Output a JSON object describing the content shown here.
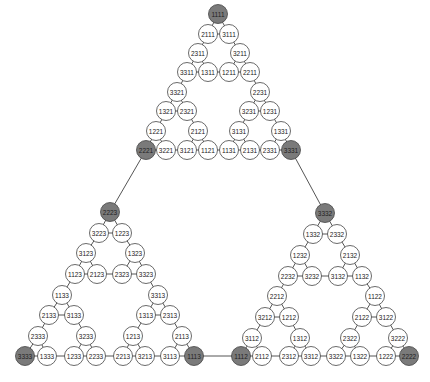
{
  "diagram": {
    "type": "sierpinski-graph",
    "node_radius": 9.5,
    "colors": {
      "node_fill": "#ffffff",
      "extreme_node_fill": "#7a7a7a",
      "edge": "#555555",
      "node_stroke": "#444444"
    },
    "nodes": [
      {
        "id": "1111",
        "x": 218,
        "y": 14,
        "extreme": true
      },
      {
        "id": "2111",
        "x": 208,
        "y": 34
      },
      {
        "id": "3111",
        "x": 229,
        "y": 34
      },
      {
        "id": "2311",
        "x": 198,
        "y": 53
      },
      {
        "id": "3211",
        "x": 240,
        "y": 53
      },
      {
        "id": "3311",
        "x": 187,
        "y": 72
      },
      {
        "id": "1311",
        "x": 208,
        "y": 72
      },
      {
        "id": "1211",
        "x": 229,
        "y": 72
      },
      {
        "id": "2211",
        "x": 250,
        "y": 72
      },
      {
        "id": "3321",
        "x": 177,
        "y": 92
      },
      {
        "id": "2231",
        "x": 260,
        "y": 92
      },
      {
        "id": "1321",
        "x": 166,
        "y": 111
      },
      {
        "id": "2321",
        "x": 187,
        "y": 111
      },
      {
        "id": "3231",
        "x": 249,
        "y": 111
      },
      {
        "id": "1231",
        "x": 270,
        "y": 111
      },
      {
        "id": "1221",
        "x": 156,
        "y": 131
      },
      {
        "id": "2121",
        "x": 198,
        "y": 131
      },
      {
        "id": "3131",
        "x": 239,
        "y": 131
      },
      {
        "id": "1331",
        "x": 281,
        "y": 131
      },
      {
        "id": "2221",
        "x": 146,
        "y": 150,
        "extreme": true
      },
      {
        "id": "3221",
        "x": 166,
        "y": 150
      },
      {
        "id": "3121",
        "x": 187,
        "y": 150
      },
      {
        "id": "1121",
        "x": 208,
        "y": 150
      },
      {
        "id": "1131",
        "x": 229,
        "y": 150
      },
      {
        "id": "2131",
        "x": 250,
        "y": 150
      },
      {
        "id": "2331",
        "x": 270,
        "y": 150
      },
      {
        "id": "3331",
        "x": 291,
        "y": 150,
        "extreme": true
      },
      {
        "id": "2223",
        "x": 110,
        "y": 212,
        "extreme": true
      },
      {
        "id": "3223",
        "x": 99,
        "y": 233
      },
      {
        "id": "1223",
        "x": 122,
        "y": 233
      },
      {
        "id": "3123",
        "x": 86,
        "y": 253
      },
      {
        "id": "1323",
        "x": 135,
        "y": 253
      },
      {
        "id": "1123",
        "x": 75,
        "y": 274
      },
      {
        "id": "2123",
        "x": 97,
        "y": 274
      },
      {
        "id": "2323",
        "x": 122,
        "y": 274
      },
      {
        "id": "3323",
        "x": 146,
        "y": 274
      },
      {
        "id": "1133",
        "x": 62,
        "y": 295
      },
      {
        "id": "3313",
        "x": 158,
        "y": 295
      },
      {
        "id": "2133",
        "x": 49,
        "y": 315
      },
      {
        "id": "3133",
        "x": 74,
        "y": 315
      },
      {
        "id": "1313",
        "x": 146,
        "y": 315
      },
      {
        "id": "2313",
        "x": 170,
        "y": 315
      },
      {
        "id": "2333",
        "x": 38,
        "y": 336
      },
      {
        "id": "3233",
        "x": 86,
        "y": 336
      },
      {
        "id": "1213",
        "x": 133,
        "y": 336
      },
      {
        "id": "2113",
        "x": 182,
        "y": 336
      },
      {
        "id": "3333",
        "x": 25,
        "y": 356,
        "extreme": true
      },
      {
        "id": "1333",
        "x": 47,
        "y": 356
      },
      {
        "id": "1233",
        "x": 74,
        "y": 356
      },
      {
        "id": "2233",
        "x": 96,
        "y": 356
      },
      {
        "id": "2213",
        "x": 123,
        "y": 356
      },
      {
        "id": "3213",
        "x": 145,
        "y": 356
      },
      {
        "id": "3113",
        "x": 170,
        "y": 356
      },
      {
        "id": "1113",
        "x": 194,
        "y": 356,
        "extreme": true
      },
      {
        "id": "3332",
        "x": 325,
        "y": 213,
        "extreme": true
      },
      {
        "id": "1332",
        "x": 313,
        "y": 234
      },
      {
        "id": "2332",
        "x": 337,
        "y": 234
      },
      {
        "id": "1232",
        "x": 300,
        "y": 255
      },
      {
        "id": "2132",
        "x": 350,
        "y": 255
      },
      {
        "id": "2232",
        "x": 288,
        "y": 276
      },
      {
        "id": "3232",
        "x": 312,
        "y": 276
      },
      {
        "id": "3132",
        "x": 338,
        "y": 276
      },
      {
        "id": "1132",
        "x": 362,
        "y": 276
      },
      {
        "id": "2212",
        "x": 277,
        "y": 296
      },
      {
        "id": "1122",
        "x": 375,
        "y": 296
      },
      {
        "id": "3212",
        "x": 265,
        "y": 317
      },
      {
        "id": "1212",
        "x": 289,
        "y": 317
      },
      {
        "id": "2122",
        "x": 362,
        "y": 317
      },
      {
        "id": "3122",
        "x": 386,
        "y": 317
      },
      {
        "id": "3112",
        "x": 252,
        "y": 338
      },
      {
        "id": "1312",
        "x": 300,
        "y": 338
      },
      {
        "id": "2322",
        "x": 350,
        "y": 338
      },
      {
        "id": "3222",
        "x": 398,
        "y": 338
      },
      {
        "id": "1112",
        "x": 241,
        "y": 356,
        "extreme": true
      },
      {
        "id": "2112",
        "x": 262,
        "y": 356
      },
      {
        "id": "2312",
        "x": 289,
        "y": 356
      },
      {
        "id": "3312",
        "x": 311,
        "y": 356
      },
      {
        "id": "3322",
        "x": 336,
        "y": 356
      },
      {
        "id": "1322",
        "x": 360,
        "y": 356
      },
      {
        "id": "1222",
        "x": 386,
        "y": 356
      },
      {
        "id": "2222",
        "x": 409,
        "y": 356,
        "extreme": true
      }
    ],
    "edges": [
      [
        "1111",
        "2111"
      ],
      [
        "1111",
        "3111"
      ],
      [
        "2111",
        "3111"
      ],
      [
        "2111",
        "2311"
      ],
      [
        "3111",
        "3211"
      ],
      [
        "2311",
        "3311"
      ],
      [
        "2311",
        "1311"
      ],
      [
        "3311",
        "1311"
      ],
      [
        "3211",
        "1211"
      ],
      [
        "3211",
        "2211"
      ],
      [
        "1211",
        "2211"
      ],
      [
        "1311",
        "1211"
      ],
      [
        "3311",
        "3321"
      ],
      [
        "2211",
        "2231"
      ],
      [
        "3321",
        "1321"
      ],
      [
        "3321",
        "2321"
      ],
      [
        "1321",
        "2321"
      ],
      [
        "2231",
        "3231"
      ],
      [
        "2231",
        "1231"
      ],
      [
        "3231",
        "1231"
      ],
      [
        "1321",
        "1221"
      ],
      [
        "2321",
        "2121"
      ],
      [
        "3231",
        "3131"
      ],
      [
        "1231",
        "1331"
      ],
      [
        "1221",
        "2221"
      ],
      [
        "1221",
        "3221"
      ],
      [
        "2221",
        "3221"
      ],
      [
        "2121",
        "3121"
      ],
      [
        "2121",
        "1121"
      ],
      [
        "3121",
        "1121"
      ],
      [
        "3221",
        "3121"
      ],
      [
        "3131",
        "1131"
      ],
      [
        "3131",
        "2131"
      ],
      [
        "1131",
        "2131"
      ],
      [
        "1121",
        "1131"
      ],
      [
        "1331",
        "2331"
      ],
      [
        "1331",
        "3331"
      ],
      [
        "2331",
        "3331"
      ],
      [
        "2131",
        "2331"
      ],
      [
        "2221",
        "2223"
      ],
      [
        "3331",
        "3332"
      ],
      [
        "2223",
        "3223"
      ],
      [
        "2223",
        "1223"
      ],
      [
        "3223",
        "1223"
      ],
      [
        "3223",
        "3123"
      ],
      [
        "1223",
        "1323"
      ],
      [
        "3123",
        "1123"
      ],
      [
        "3123",
        "2123"
      ],
      [
        "1123",
        "2123"
      ],
      [
        "1323",
        "2323"
      ],
      [
        "1323",
        "3323"
      ],
      [
        "2323",
        "3323"
      ],
      [
        "2123",
        "2323"
      ],
      [
        "1123",
        "1133"
      ],
      [
        "3323",
        "3313"
      ],
      [
        "1133",
        "2133"
      ],
      [
        "1133",
        "3133"
      ],
      [
        "2133",
        "3133"
      ],
      [
        "3313",
        "1313"
      ],
      [
        "3313",
        "2313"
      ],
      [
        "1313",
        "2313"
      ],
      [
        "2133",
        "2333"
      ],
      [
        "3133",
        "3233"
      ],
      [
        "1313",
        "1213"
      ],
      [
        "2313",
        "2113"
      ],
      [
        "2333",
        "3333"
      ],
      [
        "2333",
        "1333"
      ],
      [
        "3333",
        "1333"
      ],
      [
        "3233",
        "1233"
      ],
      [
        "3233",
        "2233"
      ],
      [
        "1233",
        "2233"
      ],
      [
        "1333",
        "1233"
      ],
      [
        "1213",
        "2213"
      ],
      [
        "1213",
        "3213"
      ],
      [
        "2213",
        "3213"
      ],
      [
        "2233",
        "2213"
      ],
      [
        "2113",
        "3113"
      ],
      [
        "2113",
        "1113"
      ],
      [
        "3113",
        "1113"
      ],
      [
        "3213",
        "3113"
      ],
      [
        "1113",
        "1112"
      ],
      [
        "3332",
        "1332"
      ],
      [
        "3332",
        "2332"
      ],
      [
        "1332",
        "2332"
      ],
      [
        "1332",
        "1232"
      ],
      [
        "2332",
        "2132"
      ],
      [
        "1232",
        "2232"
      ],
      [
        "1232",
        "3232"
      ],
      [
        "2232",
        "3232"
      ],
      [
        "2132",
        "3132"
      ],
      [
        "2132",
        "1132"
      ],
      [
        "3132",
        "1132"
      ],
      [
        "3232",
        "3132"
      ],
      [
        "2232",
        "2212"
      ],
      [
        "1132",
        "1122"
      ],
      [
        "2212",
        "3212"
      ],
      [
        "2212",
        "1212"
      ],
      [
        "3212",
        "1212"
      ],
      [
        "1122",
        "2122"
      ],
      [
        "1122",
        "3122"
      ],
      [
        "2122",
        "3122"
      ],
      [
        "3212",
        "3112"
      ],
      [
        "1212",
        "1312"
      ],
      [
        "2122",
        "2322"
      ],
      [
        "3122",
        "3222"
      ],
      [
        "3112",
        "1112"
      ],
      [
        "3112",
        "2112"
      ],
      [
        "1112",
        "2112"
      ],
      [
        "1312",
        "2312"
      ],
      [
        "1312",
        "3312"
      ],
      [
        "2312",
        "3312"
      ],
      [
        "2112",
        "2312"
      ],
      [
        "2322",
        "3322"
      ],
      [
        "2322",
        "1322"
      ],
      [
        "3322",
        "1322"
      ],
      [
        "3312",
        "3322"
      ],
      [
        "3222",
        "1222"
      ],
      [
        "3222",
        "2222"
      ],
      [
        "1222",
        "2222"
      ],
      [
        "1322",
        "1222"
      ]
    ]
  }
}
